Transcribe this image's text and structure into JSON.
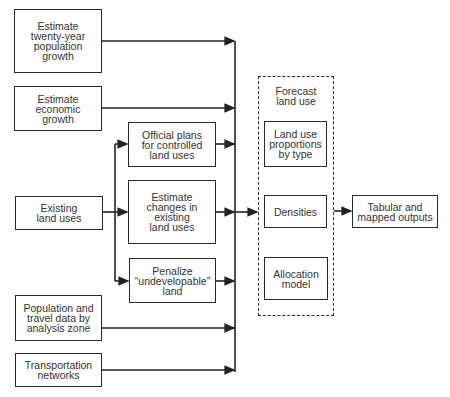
{
  "diagram": {
    "inputs": [
      {
        "id": "pop-growth",
        "label": "Estimate\ntwenty-year\npopulation\ngrowth"
      },
      {
        "id": "econ-growth",
        "label": "Estimate\neconomic\ngrowth"
      },
      {
        "id": "existing-land",
        "label": "Existing\nland uses"
      },
      {
        "id": "pop-travel",
        "label": "Population and\ntravel data by\nanalysis zone"
      },
      {
        "id": "transport",
        "label": "Transportation\nnetworks"
      }
    ],
    "intermediate": [
      {
        "id": "official-plans",
        "label": "Official plans\nfor controlled\nland uses"
      },
      {
        "id": "estimate-changes",
        "label": "Estimate\nchanges in\nexisting\nland uses"
      },
      {
        "id": "penalize",
        "label": "Penalize\n“undevelopable”\nland"
      }
    ],
    "forecast": {
      "title": "Forecast\nland use",
      "components": [
        {
          "id": "proportions",
          "label": "Land use\nproportions\nby type"
        },
        {
          "id": "densities",
          "label": "Densities"
        },
        {
          "id": "allocation",
          "label": "Allocation\nmodel"
        }
      ]
    },
    "output": {
      "id": "outputs",
      "label": "Tabular and\nmapped outputs"
    },
    "edges": [
      [
        "pop-growth",
        "forecast"
      ],
      [
        "econ-growth",
        "forecast"
      ],
      [
        "existing-land",
        "official-plans"
      ],
      [
        "existing-land",
        "estimate-changes"
      ],
      [
        "existing-land",
        "penalize"
      ],
      [
        "official-plans",
        "forecast"
      ],
      [
        "estimate-changes",
        "forecast"
      ],
      [
        "penalize",
        "forecast"
      ],
      [
        "pop-travel",
        "forecast"
      ],
      [
        "transport",
        "forecast"
      ],
      [
        "forecast",
        "outputs"
      ]
    ]
  }
}
